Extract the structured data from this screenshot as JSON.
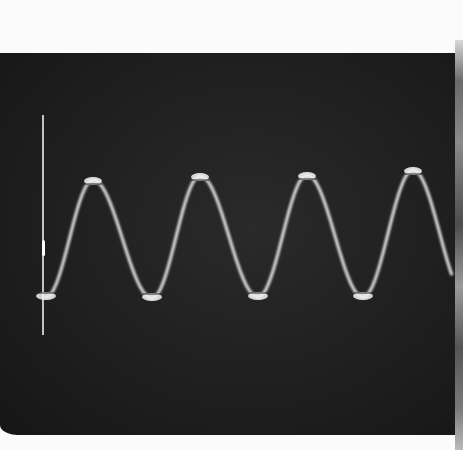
{
  "image": {
    "subject": "oscilloscope sine wave trace photograph",
    "colors": {
      "background_paper": "#fbfbfb",
      "screen": "#1f1f1f",
      "trace": "#d9d9d9",
      "trace_highlight": "#f2f2f2",
      "marker_line": "#eeeeee"
    },
    "trace": {
      "peaks": [
        [
          93,
          180
        ],
        [
          200,
          176
        ],
        [
          307,
          175
        ],
        [
          413,
          170
        ]
      ],
      "troughs": [
        [
          46,
          297
        ],
        [
          152,
          298
        ],
        [
          258,
          297
        ],
        [
          363,
          297
        ]
      ],
      "period_px": 107,
      "baseline_y": 237
    },
    "marker": {
      "x": 43,
      "y_top": 115,
      "y_bottom": 335
    }
  }
}
